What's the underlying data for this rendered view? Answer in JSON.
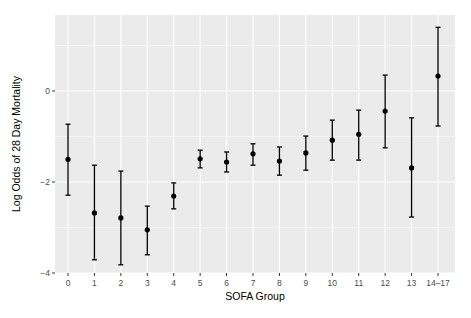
{
  "chart_data": {
    "type": "errorbar",
    "title": "",
    "xlabel": "SOFA Group",
    "ylabel": "Log Odds of 28 Day Mortality",
    "categories": [
      "0",
      "1",
      "2",
      "3",
      "4",
      "5",
      "6",
      "7",
      "8",
      "9",
      "10",
      "11",
      "12",
      "13",
      "14–17"
    ],
    "series": [
      {
        "name": "Log Odds",
        "values": [
          -1.5,
          -2.68,
          -2.79,
          -3.05,
          -2.31,
          -1.49,
          -1.56,
          -1.38,
          -1.54,
          -1.36,
          -1.08,
          -0.95,
          -0.44,
          -1.69,
          0.33
        ],
        "lower": [
          -2.29,
          -3.71,
          -3.82,
          -3.6,
          -2.59,
          -1.69,
          -1.78,
          -1.63,
          -1.85,
          -1.74,
          -1.52,
          -1.52,
          -1.25,
          -2.77,
          -0.77
        ],
        "upper": [
          -0.73,
          -1.63,
          -1.76,
          -2.53,
          -2.02,
          -1.3,
          -1.34,
          -1.16,
          -1.23,
          -0.99,
          -0.64,
          -0.42,
          0.35,
          -0.59,
          1.4
        ]
      }
    ],
    "yticks": [
      -4,
      -2,
      0
    ],
    "ylim": [
      -4.0,
      1.7
    ],
    "grid": true,
    "legend": "none",
    "colors": {
      "panel_bg": "#ebebeb",
      "grid": "#ffffff",
      "point": "#000000",
      "tick_text": "#4d4d4d"
    }
  }
}
